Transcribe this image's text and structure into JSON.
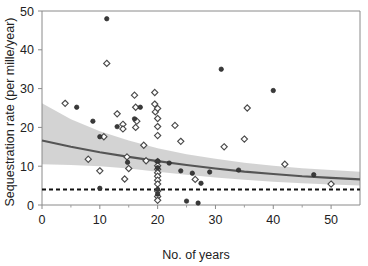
{
  "chart_data": {
    "type": "scatter",
    "title": "",
    "xlabel": "No. of years",
    "ylabel": "Sequestration rate (per mille/year)",
    "xlim": [
      0,
      55
    ],
    "ylim": [
      0,
      50
    ],
    "xticks": [
      0,
      10,
      20,
      30,
      40,
      50
    ],
    "xtick_labels": [
      "0",
      "10",
      "20",
      "30",
      "40",
      "50"
    ],
    "xminor_ticks": [
      5,
      15,
      25,
      35,
      45
    ],
    "yticks": [
      0,
      10,
      20,
      30,
      40,
      50
    ],
    "ytick_labels": [
      "0",
      "10",
      "20",
      "30",
      "40",
      "50"
    ],
    "grid": false,
    "legend": null,
    "series": [
      {
        "name": "open-diamond-points",
        "marker": "open-diamond",
        "points": [
          [
            4.0,
            26.2
          ],
          [
            8.0,
            11.8
          ],
          [
            10.0,
            8.8
          ],
          [
            10.7,
            17.6
          ],
          [
            11.2,
            36.5
          ],
          [
            13.0,
            23.5
          ],
          [
            14.0,
            20.8
          ],
          [
            14.0,
            19.6
          ],
          [
            14.3,
            6.7
          ],
          [
            14.7,
            12.4
          ],
          [
            15.0,
            9.4
          ],
          [
            16.0,
            28.3
          ],
          [
            16.2,
            25.2
          ],
          [
            16.2,
            20.0
          ],
          [
            16.4,
            21.6
          ],
          [
            17.6,
            15.4
          ],
          [
            18.0,
            11.4
          ],
          [
            19.5,
            29.0
          ],
          [
            19.5,
            26.0
          ],
          [
            19.6,
            24.0
          ],
          [
            20.0,
            24.9
          ],
          [
            20.0,
            22.3
          ],
          [
            20.0,
            20.2
          ],
          [
            20.0,
            17.9
          ],
          [
            20.0,
            11.2
          ],
          [
            20.0,
            10.1
          ],
          [
            20.0,
            9.2
          ],
          [
            20.0,
            8.3
          ],
          [
            20.0,
            7.4
          ],
          [
            20.0,
            6.4
          ],
          [
            20.0,
            5.4
          ],
          [
            20.0,
            3.6
          ],
          [
            20.0,
            2.2
          ],
          [
            20.0,
            1.2
          ],
          [
            23.0,
            20.5
          ],
          [
            24.0,
            16.4
          ],
          [
            26.5,
            6.6
          ],
          [
            31.5,
            15.0
          ],
          [
            35.0,
            17.0
          ],
          [
            35.5,
            25.0
          ],
          [
            42.0,
            10.5
          ],
          [
            50.0,
            5.4
          ]
        ]
      },
      {
        "name": "filled-circle-points",
        "marker": "filled-circle",
        "points": [
          [
            6.0,
            25.2
          ],
          [
            8.8,
            21.6
          ],
          [
            10.0,
            17.6
          ],
          [
            10.0,
            4.3
          ],
          [
            11.2,
            48.0
          ],
          [
            13.0,
            20.2
          ],
          [
            14.8,
            11.0
          ],
          [
            16.0,
            22.2
          ],
          [
            17.0,
            25.2
          ],
          [
            20.0,
            11.3
          ],
          [
            20.0,
            9.6
          ],
          [
            20.0,
            4.0
          ],
          [
            20.0,
            2.8
          ],
          [
            22.0,
            10.8
          ],
          [
            24.0,
            8.8
          ],
          [
            25.0,
            1.0
          ],
          [
            26.0,
            8.2
          ],
          [
            27.0,
            0.5
          ],
          [
            27.5,
            5.6
          ],
          [
            29.0,
            8.5
          ],
          [
            31.0,
            35.0
          ],
          [
            34.0,
            9.0
          ],
          [
            40.0,
            29.5
          ],
          [
            47.0,
            7.8
          ]
        ]
      }
    ],
    "fit_line": {
      "name": "fitted-curve",
      "description": "decaying fitted regression curve",
      "points": [
        [
          0,
          16.6
        ],
        [
          5,
          15.0
        ],
        [
          10,
          13.6
        ],
        [
          15,
          12.4
        ],
        [
          20,
          11.3
        ],
        [
          25,
          10.3
        ],
        [
          30,
          9.4
        ],
        [
          35,
          8.6
        ],
        [
          40,
          8.0
        ],
        [
          45,
          7.4
        ],
        [
          50,
          7.0
        ],
        [
          55,
          6.6
        ]
      ]
    },
    "confidence_band": {
      "name": "confidence-interval",
      "upper": [
        [
          0,
          26.2
        ],
        [
          5,
          22.1
        ],
        [
          10,
          19.0
        ],
        [
          15,
          16.6
        ],
        [
          20,
          14.6
        ],
        [
          25,
          13.1
        ],
        [
          30,
          11.9
        ],
        [
          35,
          10.9
        ],
        [
          40,
          10.1
        ],
        [
          45,
          9.5
        ],
        [
          50,
          9.0
        ],
        [
          55,
          8.6
        ]
      ],
      "lower": [
        [
          0,
          10.5
        ],
        [
          5,
          10.3
        ],
        [
          10,
          10.0
        ],
        [
          15,
          9.4
        ],
        [
          20,
          8.6
        ],
        [
          25,
          7.8
        ],
        [
          30,
          7.1
        ],
        [
          35,
          6.5
        ],
        [
          40,
          6.0
        ],
        [
          45,
          5.6
        ],
        [
          50,
          5.3
        ],
        [
          55,
          5.0
        ]
      ]
    },
    "reference_line": {
      "name": "reference-dashed-line",
      "style": "dashed",
      "y": 4.0
    },
    "colors": {
      "band": "#c8c8c8",
      "fit_line": "#555555",
      "reference_line": "#111111",
      "open_marker_edge": "#4a4a4a",
      "filled_marker": "#3a3a3a",
      "axis": "#8a8a8a",
      "text": "#222222",
      "background": "#ffffff"
    }
  }
}
